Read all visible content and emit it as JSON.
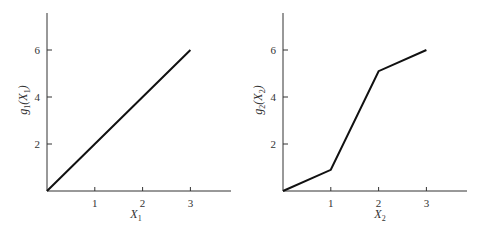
{
  "chart_data": [
    {
      "type": "line",
      "title": "",
      "xlabel": "X_1",
      "ylabel": "g_1(X_1)",
      "x_ticks": [
        "1",
        "2",
        "3"
      ],
      "y_ticks": [
        "2",
        "4",
        "6"
      ],
      "xlim": [
        0,
        3.8
      ],
      "ylim": [
        0,
        7.5
      ],
      "grid": false,
      "series": [
        {
          "name": "g1",
          "x": [
            0,
            1,
            2,
            3
          ],
          "values": [
            0,
            2,
            4,
            6
          ],
          "color": "#111111"
        }
      ]
    },
    {
      "type": "line",
      "title": "",
      "xlabel": "X_2",
      "ylabel": "g_2(X_2)",
      "x_ticks": [
        "1",
        "2",
        "3"
      ],
      "y_ticks": [
        "2",
        "4",
        "6"
      ],
      "xlim": [
        0,
        3.8
      ],
      "ylim": [
        0,
        7.5
      ],
      "grid": false,
      "series": [
        {
          "name": "g2",
          "x": [
            0,
            1,
            2,
            3
          ],
          "values": [
            0,
            0.9,
            5.1,
            6
          ],
          "color": "#111111"
        }
      ]
    }
  ],
  "labels": {
    "left": {
      "y_main": "g",
      "y_sub": "1",
      "y_open": "(X",
      "y_sub2": "1",
      "y_close": ")",
      "x_main": "X",
      "x_sub": "1"
    },
    "right": {
      "y_main": "g",
      "y_sub": "2",
      "y_open": "(X",
      "y_sub2": "2",
      "y_close": ")",
      "x_main": "X",
      "x_sub": "2"
    }
  }
}
